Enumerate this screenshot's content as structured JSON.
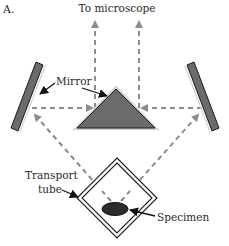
{
  "figure": {
    "panel_label": "A.",
    "title": "To microscope",
    "labels": {
      "mirror": "Mirror",
      "transport_tube_line1": "Transport",
      "transport_tube_line2": "tube",
      "specimen": "Specimen"
    },
    "colors": {
      "mirror_fill": "#6b6b6b",
      "prism_fill": "#6b6b6b",
      "light_path": "#8c8c8c",
      "specimen_fill": "#2b2b2b",
      "text": "#2a2a2a",
      "outline": "#1a1a1a"
    },
    "components": [
      "left-mirror",
      "central-prism-mirror",
      "right-mirror",
      "transport-tube",
      "specimen",
      "light-paths-to-microscope"
    ]
  }
}
